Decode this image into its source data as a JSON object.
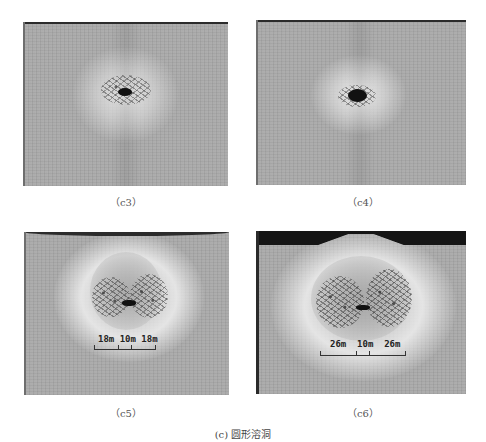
{
  "figure": {
    "caption": "(c) 圆形溶洞",
    "panels": [
      {
        "id": "c3",
        "label": "（c3）"
      },
      {
        "id": "c4",
        "label": "（c4）"
      },
      {
        "id": "c5",
        "label": "（c5）",
        "scale_bar": {
          "segments": [
            "18m",
            "10m",
            "18m"
          ],
          "text": "18m 10m 18m"
        }
      },
      {
        "id": "c6",
        "label": "（c6）",
        "scale_bar": {
          "segments": [
            "26m",
            "10m",
            "26m"
          ],
          "text": "26m  10m  26m"
        }
      }
    ]
  },
  "colors": {
    "background": "#ffffff",
    "rock_gray": "#a7a7a7",
    "halo_light": "#e4e4e4",
    "cavity": "#111111"
  }
}
